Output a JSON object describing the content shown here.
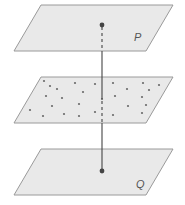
{
  "figure": {
    "planes": [
      {
        "id": "P",
        "label": "P",
        "points": "41,5 173,5 146,51 14,51",
        "label_pos": [
          134,
          41
        ]
      },
      {
        "id": "middle",
        "label": "",
        "points": "41,77 173,77 146,123 14,123"
      },
      {
        "id": "Q",
        "label": "Q",
        "points": "41,149 173,149 146,195 14,195",
        "label_pos": [
          136,
          188
        ]
      }
    ],
    "labels": {
      "top_plane": "P",
      "bottom_plane": "Q"
    },
    "point_P": [
      102,
      25
    ],
    "point_Q": [
      102,
      171
    ],
    "scatter_points": [
      [
        44,
        81
      ],
      [
        50,
        86
      ],
      [
        57,
        89
      ],
      [
        75,
        83
      ],
      [
        95,
        84
      ],
      [
        113,
        83
      ],
      [
        127,
        89
      ],
      [
        143,
        83
      ],
      [
        159,
        85
      ],
      [
        149,
        90
      ],
      [
        46,
        96
      ],
      [
        62,
        98
      ],
      [
        83,
        92
      ],
      [
        102,
        99
      ],
      [
        115,
        96
      ],
      [
        142,
        97
      ],
      [
        52,
        106
      ],
      [
        79,
        104
      ],
      [
        128,
        106
      ],
      [
        146,
        105
      ],
      [
        30,
        110
      ],
      [
        64,
        114
      ],
      [
        95,
        112
      ],
      [
        113,
        115
      ],
      [
        142,
        113
      ],
      [
        43,
        116
      ],
      [
        79,
        116
      ]
    ],
    "colors": {
      "plane_fill": "#e9e9e9",
      "plane_stroke": "#9a9a9a",
      "line": "#444444",
      "dots": "#6a6a6a"
    }
  }
}
